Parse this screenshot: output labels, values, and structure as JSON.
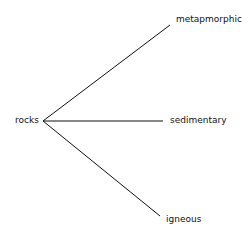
{
  "diagram": {
    "type": "tree",
    "root": {
      "label": "rocks"
    },
    "children": [
      {
        "label": "metapmorphic"
      },
      {
        "label": "sedimentary"
      },
      {
        "label": "igneous"
      }
    ]
  }
}
